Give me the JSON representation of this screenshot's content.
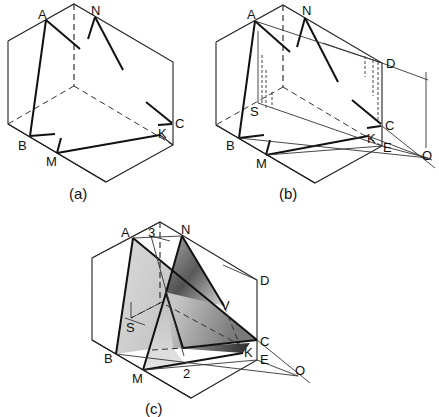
{
  "figure": {
    "panels": [
      {
        "caption": "(a)",
        "labels": {
          "A": "A",
          "N": "N",
          "B": "B",
          "M": "M",
          "K": "K",
          "C": "C"
        }
      },
      {
        "caption": "(b)",
        "labels": {
          "A": "A",
          "N": "N",
          "D": "D",
          "S": "S",
          "C": "C",
          "K": "K",
          "E": "E",
          "B": "B",
          "M": "M",
          "O": "O"
        }
      },
      {
        "caption": "(c)",
        "labels": {
          "A": "A",
          "three": "3",
          "N": "N",
          "D": "D",
          "V": "V",
          "S": "S",
          "C": "C",
          "K": "K",
          "E": "E",
          "B": "B",
          "M": "M",
          "two": "2",
          "O": "O"
        }
      }
    ],
    "colors": {
      "line": "#222222",
      "shade_light": "#c8c8c8",
      "shade_dark": "#2a2a2a",
      "background": "#ffffff"
    }
  }
}
